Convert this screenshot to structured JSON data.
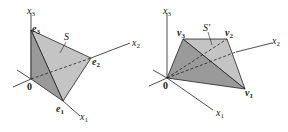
{
  "figure_left": {
    "title": "S",
    "origin_label": "0",
    "axes": {
      "x1": "x",
      "x1_sub": "1",
      "x2": "x",
      "x2_sub": "2",
      "x3": "x",
      "x3_sub": "3"
    },
    "vertices": [
      {
        "name": "e",
        "sub": "1"
      },
      {
        "name": "e",
        "sub": "2"
      },
      {
        "name": "e",
        "sub": "3"
      }
    ]
  },
  "figure_right": {
    "title": "S′",
    "origin_label": "0",
    "axes": {
      "x1": "x",
      "x1_sub": "1",
      "x2": "x",
      "x2_sub": "2",
      "x3": "x",
      "x3_sub": "3"
    },
    "vertices": [
      {
        "name": "v",
        "sub": "1"
      },
      {
        "name": "v",
        "sub": "2"
      },
      {
        "name": "v",
        "sub": "3"
      }
    ]
  },
  "colors": {
    "face_light": "#c4c4c4",
    "face_mid": "#a8a8a8",
    "face_dark": "#8e8e8e",
    "line": "#222222"
  }
}
